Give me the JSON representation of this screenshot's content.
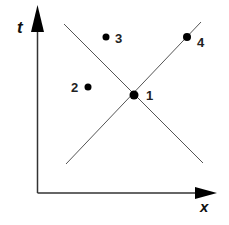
{
  "diagram": {
    "type": "spacetime-diagram",
    "axes": {
      "vertical": {
        "label": "t"
      },
      "horizontal": {
        "label": "x"
      }
    },
    "lines": [
      {
        "name": "line-down-right",
        "from": [
          64,
          24
        ],
        "to": [
          203,
          163
        ]
      },
      {
        "name": "line-up-right",
        "from": [
          66,
          164
        ],
        "to": [
          201,
          22
        ]
      }
    ],
    "points": [
      {
        "id": "1",
        "label": "1",
        "x": 134,
        "y": 95
      },
      {
        "id": "2",
        "label": "2",
        "x": 88,
        "y": 87
      },
      {
        "id": "3",
        "label": "3",
        "x": 106,
        "y": 37
      },
      {
        "id": "4",
        "label": "4",
        "x": 187,
        "y": 37
      }
    ],
    "colors": {
      "axis": "#333333",
      "line": "#555555",
      "point": "#000000"
    }
  }
}
